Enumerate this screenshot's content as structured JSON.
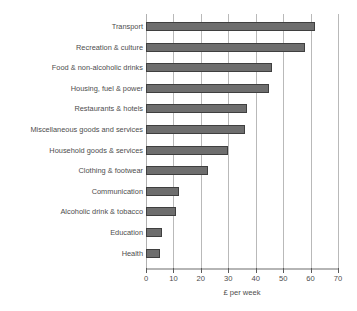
{
  "chart_data": {
    "type": "bar",
    "orientation": "horizontal",
    "title": "",
    "xlabel": "£ per week",
    "ylabel": "",
    "xlim": [
      0,
      70
    ],
    "xticks": [
      0,
      10,
      20,
      30,
      40,
      50,
      60,
      70
    ],
    "xtick_labels": [
      "0",
      "10",
      "20",
      "30",
      "40",
      "50",
      "60",
      "70"
    ],
    "grid": "vertical",
    "legend": "none",
    "bar_color": "#6e6e6e",
    "bar_edge_color": "#3f3f3f",
    "gridline_color": "#b9b9b9",
    "axis_color": "#b5b5b5",
    "text_color": "#4d4d4d",
    "categories": [
      "Transport",
      "Recreation & culture",
      "Food & non-alcoholic drinks",
      "Housing, fuel & power",
      "Restaurants & hotels",
      "Miscellaneous goods and services",
      "Household goods & services",
      "Clothing & footwear",
      "Communication",
      "Alcoholic drink & tobacco",
      "Education",
      "Health"
    ],
    "values": [
      61.5,
      58.0,
      45.8,
      45.0,
      37.0,
      36.0,
      30.0,
      22.5,
      12.0,
      11.0,
      6.0,
      5.0
    ]
  }
}
